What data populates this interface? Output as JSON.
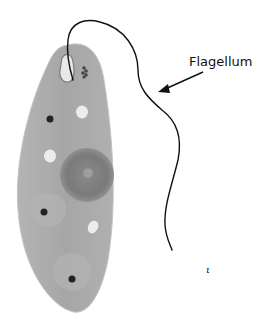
{
  "diagram": {
    "labels": [
      {
        "id": "flagellum",
        "text": "Flagellum"
      }
    ],
    "stray_mark": "ι",
    "colors": {
      "cell_body": "#a9a9a9",
      "cell_edge": "#bdbdbd",
      "nucleus": "#7c7c7c",
      "nucleolus": "#9a9a9a",
      "vacuole": "#ececec",
      "dot": "#222222",
      "flagellum": "#111111",
      "background": "#ffffff"
    }
  }
}
